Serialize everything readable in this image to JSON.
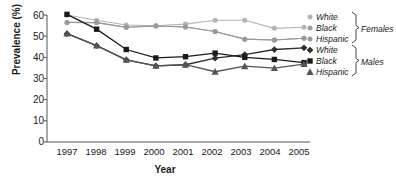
{
  "chart_data": {
    "type": "line",
    "title": "",
    "xlabel": "Year",
    "ylabel": "Prevalence (%)",
    "categories": [
      "1997",
      "1998",
      "1999",
      "2000",
      "2001",
      "2002",
      "2003",
      "2004",
      "2005"
    ],
    "x": [
      1997,
      1998,
      1999,
      2000,
      2001,
      2002,
      2003,
      2004,
      2005
    ],
    "xlim": [
      1996.5,
      2005.5
    ],
    "ylim": [
      0,
      60
    ],
    "yticks": [
      0,
      10,
      20,
      30,
      40,
      50,
      60
    ],
    "grid": false,
    "legend_position": "right",
    "series": [
      {
        "name": "White",
        "group": "Females",
        "marker": "circle",
        "color": "#b4b4b4",
        "values": [
          60.0,
          57.5,
          55.3,
          54.9,
          55.7,
          57.5,
          57.5,
          53.7,
          54.2
        ]
      },
      {
        "name": "Black",
        "group": "Females",
        "marker": "circle",
        "color": "#a0a0a0",
        "values": [
          56.5,
          56.4,
          54.2,
          54.8,
          54.3,
          52.2,
          48.6,
          48.2,
          49.0
        ]
      },
      {
        "name": "Hispanic",
        "group": "Females",
        "marker": "circle",
        "color": "#9a9a9a",
        "values": [
          56.5,
          56.4,
          54.2,
          54.8,
          54.3,
          52.2,
          48.6,
          48.2,
          49.0
        ]
      },
      {
        "name": "White",
        "group": "Males",
        "marker": "diamond",
        "color": "#2e2e2e",
        "values": [
          51.2,
          45.5,
          38.8,
          36.0,
          36.5,
          39.6,
          41.3,
          43.7,
          44.5
        ]
      },
      {
        "name": "Black",
        "group": "Males",
        "marker": "square",
        "color": "#1a1a1a",
        "values": [
          60.3,
          53.3,
          43.7,
          39.7,
          40.3,
          42.0,
          40.0,
          39.0,
          37.5
        ]
      },
      {
        "name": "Hispanic",
        "group": "Males",
        "marker": "triangle",
        "color": "#555555",
        "values": [
          51.2,
          45.5,
          38.8,
          36.0,
          36.5,
          33.2,
          35.8,
          34.9,
          36.8
        ]
      }
    ]
  },
  "axes": {
    "ylabel": "Prevalence (%)",
    "xlabel": "Year",
    "yticks": [
      "60",
      "50",
      "40",
      "30",
      "20",
      "10",
      "0"
    ],
    "xticks": [
      "1997",
      "1998",
      "1999",
      "2000",
      "2001",
      "2002",
      "2003",
      "2004",
      "2005"
    ]
  },
  "legend": {
    "females": {
      "group_label": "Females",
      "items": [
        "White",
        "Black",
        "Hispanic"
      ]
    },
    "males": {
      "group_label": "Males",
      "items": [
        "White",
        "Black",
        "Hispanic"
      ]
    }
  }
}
